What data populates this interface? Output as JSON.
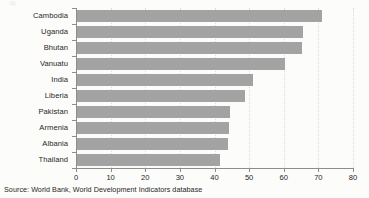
{
  "chart_data": {
    "type": "bar",
    "orientation": "horizontal",
    "title": "",
    "subtitle": "",
    "xlabel": "",
    "ylabel": "",
    "categories": [
      "Cambodia",
      "Uganda",
      "Bhutan",
      "Vanuatu",
      "India",
      "Liberia",
      "Pakistan",
      "Armenia",
      "Albania",
      "Thailand"
    ],
    "values": [
      71,
      65.5,
      65.3,
      60.5,
      51,
      48.7,
      44.5,
      44.2,
      44,
      41.5
    ],
    "xticks": [
      0,
      10,
      20,
      30,
      40,
      50,
      60,
      70,
      80
    ],
    "xticklabels": [
      "0",
      "10",
      "20",
      "30",
      "40",
      "50",
      "60",
      "70",
      "80"
    ],
    "xlim": [
      0,
      80
    ],
    "grid": "vertical-dotted",
    "legend": "none",
    "bar_color": "#a3a3a3",
    "background_color": "#fcfcfb",
    "axis_color": "#8d8d8d",
    "gridline_color": "#dcdcd8"
  },
  "source_note": "Source: World Bank, World Development Indicators database"
}
